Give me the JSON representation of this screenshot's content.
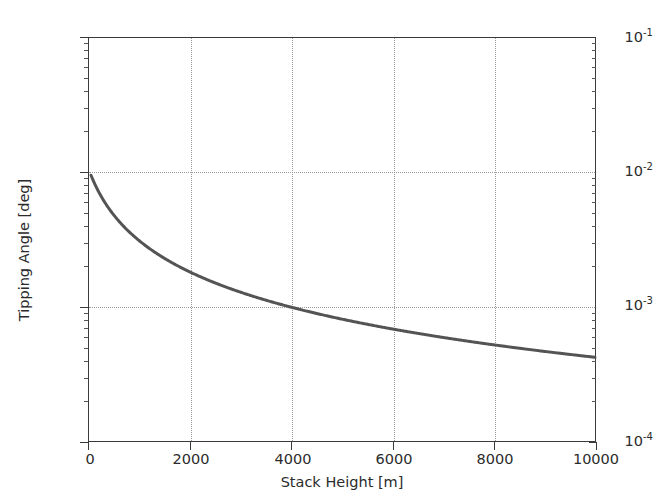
{
  "figure": {
    "background_color": "#ffffff",
    "axes_color": "#3a3a3a",
    "grid_color": "#9a9a9a",
    "curve_color": "#545454"
  },
  "axis": {
    "xlabel": "Stack Height [m]",
    "ylabel": "Tipping Angle [deg]",
    "xticklabels": [
      "0",
      "2000",
      "4000",
      "6000",
      "8000",
      "10000"
    ],
    "yticklabels_mantissa": [
      "10",
      "10",
      "10",
      "10"
    ],
    "yticklabels_exponent": [
      "-1",
      "-2",
      "-3",
      "-4"
    ]
  },
  "chart_data": {
    "type": "line",
    "title": "",
    "xlabel": "Stack Height [m]",
    "ylabel": "Tipping Angle [deg]",
    "xlim": [
      0,
      10000
    ],
    "ylim": [
      0.0001,
      0.1
    ],
    "yscale": "log",
    "xscale": "linear",
    "grid": true,
    "legend": null,
    "xticks": [
      0,
      2000,
      4000,
      6000,
      8000,
      10000
    ],
    "yticks": [
      0.0001,
      0.001,
      0.01,
      0.1
    ],
    "series": [
      {
        "name": "Tipping Angle",
        "color": "#545454",
        "linewidth": 3,
        "x": [
          50,
          100,
          150,
          200,
          250,
          300,
          400,
          500,
          600,
          700,
          800,
          900,
          1000,
          1200,
          1400,
          1600,
          1800,
          2000,
          2250,
          2500,
          2750,
          3000,
          3250,
          3500,
          3750,
          4000,
          4250,
          4500,
          4750,
          5000,
          5500,
          6000,
          6500,
          7000,
          7500,
          8000,
          8500,
          9000,
          9500,
          10000
        ],
        "y": [
          0.04,
          0.031,
          0.0252,
          0.0212,
          0.0184,
          0.0163,
          0.0134,
          0.0115,
          0.0101,
          0.00905,
          0.00822,
          0.00754,
          0.00697,
          0.00606,
          0.00537,
          0.00483,
          0.0044,
          0.00404,
          0.00366,
          0.00335,
          0.00309,
          0.00286,
          0.00267,
          0.0025,
          0.00235,
          0.001,
          0.00094,
          0.00089,
          0.00084,
          0.0008,
          0.00072,
          0.00066,
          0.00061,
          0.00057,
          0.00053,
          0.0005,
          0.00047,
          0.00045,
          0.00043,
          0.00042
        ],
        "note": "monotonic decreasing, crosses 1e-3 at x=4000, ends ~4.2e-4 at x=10000"
      }
    ]
  }
}
